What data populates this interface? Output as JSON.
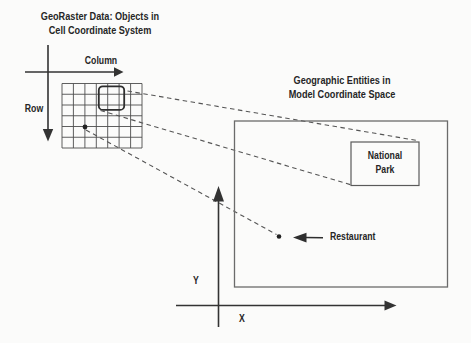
{
  "titles": {
    "cell_space": {
      "line1": "GeoRaster Data: Objects in",
      "line2": "Cell Coordinate System"
    },
    "model_space": {
      "line1": "Geographic Entities in",
      "line2": "Model Coordinate Space"
    }
  },
  "cell_axes": {
    "column_label": "Column",
    "row_label": "Row"
  },
  "model_axes": {
    "x_label": "X",
    "y_label": "Y"
  },
  "entities": {
    "national_park": {
      "line1": "National",
      "line2": "Park"
    },
    "restaurant": {
      "label": "Restaurant"
    }
  },
  "colors": {
    "ink": "#333333",
    "grid_line": "#4d4d4d",
    "box_line": "#5f5f5f",
    "background": "#fbfbfa"
  }
}
